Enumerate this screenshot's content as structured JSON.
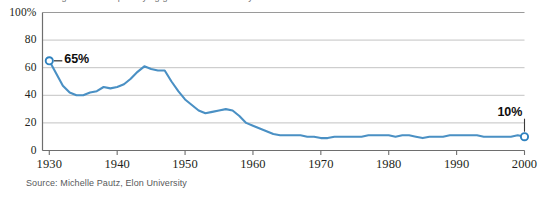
{
  "figure": {
    "clipped_title": "Percentage of movies portraying government favorably",
    "source_note": "Source: Michelle Pautz, Elon University"
  },
  "annotations": {
    "start_label": "65%",
    "end_label": "10%"
  },
  "colors": {
    "line": "#4a90c4",
    "marker_stroke": "#2f82bf",
    "gridline": "#bcbcbc",
    "axis": "#7a7a7a",
    "text": "#231f20",
    "source_text": "#58595b",
    "annotation_text": "#0d0d0d",
    "background": "#ffffff"
  },
  "chart_data": {
    "type": "line",
    "title": "",
    "xlabel": "",
    "ylabel": "",
    "xlim": [
      1929,
      2000
    ],
    "ylim": [
      0,
      100
    ],
    "grid": true,
    "grid_axis": "y",
    "legend": "none",
    "y_ticks": [
      0,
      20,
      40,
      60,
      80,
      100
    ],
    "y_tick_labels": [
      "0",
      "20",
      "40",
      "60",
      "80",
      "100%"
    ],
    "x_ticks": [
      1930,
      1940,
      1950,
      1960,
      1970,
      1980,
      1990,
      2000
    ],
    "x_tick_labels": [
      "1930",
      "1940",
      "1950",
      "1960",
      "1970",
      "1980",
      "1990",
      "2000"
    ],
    "markers": [
      {
        "x": 1930,
        "y": 65,
        "label": "65%"
      },
      {
        "x": 2000,
        "y": 10,
        "label": "10%"
      }
    ],
    "series": [
      {
        "name": "Favorable portrayal",
        "color": "#4a90c4",
        "x": [
          1930,
          1931,
          1932,
          1933,
          1934,
          1935,
          1936,
          1937,
          1938,
          1939,
          1940,
          1941,
          1942,
          1943,
          1944,
          1945,
          1946,
          1947,
          1948,
          1949,
          1950,
          1951,
          1952,
          1953,
          1954,
          1955,
          1956,
          1957,
          1958,
          1959,
          1960,
          1961,
          1962,
          1963,
          1964,
          1965,
          1966,
          1967,
          1968,
          1969,
          1970,
          1971,
          1972,
          1973,
          1974,
          1975,
          1976,
          1977,
          1978,
          1979,
          1980,
          1981,
          1982,
          1983,
          1984,
          1985,
          1986,
          1987,
          1988,
          1989,
          1990,
          1991,
          1992,
          1993,
          1994,
          1995,
          1996,
          1997,
          1998,
          1999,
          2000
        ],
        "y": [
          65,
          56,
          47,
          42,
          40,
          40,
          42,
          43,
          46,
          45,
          46,
          48,
          52,
          57,
          61,
          59,
          58,
          58,
          50,
          43,
          37,
          33,
          29,
          27,
          28,
          29,
          30,
          29,
          25,
          20,
          18,
          16,
          14,
          12,
          11,
          11,
          11,
          11,
          10,
          10,
          9,
          9,
          10,
          10,
          10,
          10,
          10,
          11,
          11,
          11,
          11,
          10,
          11,
          11,
          10,
          9,
          10,
          10,
          10,
          11,
          11,
          11,
          11,
          11,
          10,
          10,
          10,
          10,
          10,
          11,
          10
        ]
      }
    ]
  }
}
